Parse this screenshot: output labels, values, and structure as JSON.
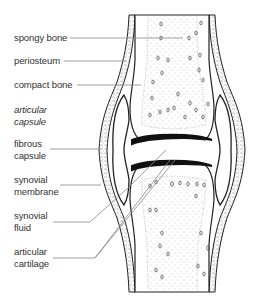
{
  "diagram": {
    "type": "anatomical-cross-section",
    "colors": {
      "background": "#ffffff",
      "outline": "#222222",
      "text": "#333333",
      "leader_line": "#888888",
      "stipple": "#777777",
      "cartilage": "#111111"
    },
    "labels": [
      {
        "id": "spongy-bone",
        "lines": [
          "spongy bone"
        ],
        "italic": false
      },
      {
        "id": "periosteum",
        "lines": [
          "periosteum"
        ],
        "italic": false
      },
      {
        "id": "compact-bone",
        "lines": [
          "compact bone"
        ],
        "italic": false
      },
      {
        "id": "articular-capsule",
        "lines": [
          "articular",
          "capsule"
        ],
        "italic": true
      },
      {
        "id": "fibrous-capsule",
        "lines": [
          "fibrous",
          "capsule"
        ],
        "italic": false
      },
      {
        "id": "synovial-membrane",
        "lines": [
          "synovial",
          "membrane"
        ],
        "italic": false
      },
      {
        "id": "synovial-fluid",
        "lines": [
          "synovial",
          "fluid"
        ],
        "italic": false
      },
      {
        "id": "articular-cartilage",
        "lines": [
          "articular",
          "cartilage"
        ],
        "italic": false
      }
    ]
  }
}
